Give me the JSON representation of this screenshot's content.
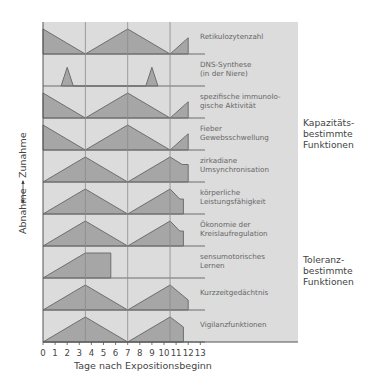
{
  "chart_data": {
    "type": "area",
    "title": "",
    "xlabel": "Tage nach Expositionsbeginn",
    "ylabel": "Abnahme ←—→ Zunahme",
    "ylabel_low": "Abnahme",
    "ylabel_high": "Zunahme",
    "x_ticks": [
      "0",
      "1",
      "2",
      "3",
      "4",
      "5",
      "6",
      "7",
      "8",
      "9",
      "10",
      "11",
      "12",
      "13"
    ],
    "xlim": [
      0,
      13
    ],
    "vertical_gridlines": [
      3.5,
      7,
      10.5
    ],
    "groups": [
      {
        "label": "Kapazitäts-\nbestimmte\nFunktionen",
        "rows": [
          0,
          1,
          2,
          3
        ]
      },
      {
        "label": "Toleranz-\nbestimmte\nFunktionen",
        "rows": [
          4,
          5,
          6,
          7,
          8,
          9
        ]
      }
    ],
    "series": [
      {
        "name": "Retikulozytenzahl",
        "points": [
          [
            0,
            1
          ],
          [
            3.5,
            0
          ],
          [
            7,
            1
          ],
          [
            10.5,
            0
          ],
          [
            12,
            0.65
          ],
          [
            12,
            0
          ]
        ]
      },
      {
        "name": "DNS-Synthese (in der Niere)",
        "points": [
          [
            1.5,
            0
          ],
          [
            2,
            0.75
          ],
          [
            2.5,
            0
          ],
          [
            8.5,
            0
          ],
          [
            9,
            0.75
          ],
          [
            9.5,
            0
          ]
        ]
      },
      {
        "name": "spezifische immunologische Aktivität",
        "points": [
          [
            0,
            1
          ],
          [
            3.5,
            0
          ],
          [
            7,
            1
          ],
          [
            10.5,
            0
          ],
          [
            12,
            0.65
          ],
          [
            12,
            0
          ]
        ]
      },
      {
        "name": "Fieber Gewebsschwellung",
        "points": [
          [
            0,
            1
          ],
          [
            3.5,
            0
          ],
          [
            7,
            1
          ],
          [
            10.5,
            0
          ],
          [
            12,
            0.65
          ],
          [
            12,
            0
          ]
        ]
      },
      {
        "name": "zirkadiane Umsynchronisation",
        "points": [
          [
            0,
            0
          ],
          [
            3.5,
            1
          ],
          [
            7,
            0
          ],
          [
            10.5,
            1
          ],
          [
            11.5,
            0.7
          ],
          [
            12,
            0.7
          ],
          [
            12,
            0
          ]
        ]
      },
      {
        "name": "körperliche Leistungsfähigkeit",
        "points": [
          [
            0,
            0
          ],
          [
            3.5,
            1
          ],
          [
            7,
            0
          ],
          [
            10.5,
            1
          ],
          [
            11.3,
            0.6
          ],
          [
            11.6,
            0.6
          ],
          [
            11.6,
            0
          ]
        ]
      },
      {
        "name": "Ökonomie der Kreislaufregulation",
        "points": [
          [
            0,
            0
          ],
          [
            3.5,
            1
          ],
          [
            7,
            0
          ],
          [
            10.5,
            1
          ],
          [
            11.3,
            0.6
          ],
          [
            11.6,
            0.6
          ],
          [
            11.6,
            0
          ]
        ]
      },
      {
        "name": "sensumotorisches Lernen",
        "points": [
          [
            0,
            0
          ],
          [
            3.5,
            1
          ],
          [
            5.6,
            1
          ],
          [
            5.6,
            0
          ]
        ]
      },
      {
        "name": "Kurzzeitgedächtnis",
        "points": [
          [
            0,
            0
          ],
          [
            3.5,
            1
          ],
          [
            7,
            0
          ],
          [
            10.5,
            1
          ],
          [
            12,
            0.4
          ],
          [
            12,
            0
          ]
        ]
      },
      {
        "name": "Vigilanzfunktionen",
        "points": [
          [
            0,
            0
          ],
          [
            3.5,
            1
          ],
          [
            7,
            0
          ],
          [
            10.5,
            1
          ],
          [
            11.6,
            0.6
          ],
          [
            11.6,
            0
          ]
        ]
      }
    ]
  },
  "rows": [
    {
      "line1": "Retikulozytenzahl",
      "line2": ""
    },
    {
      "line1": "DNS-Synthese",
      "line2": "(in der Niere)"
    },
    {
      "line1": "spezifische immunolo-",
      "line2": "gische Aktivität"
    },
    {
      "line1": "Fieber",
      "line2": "Gewebsschwellung"
    },
    {
      "line1": "zirkadiane",
      "line2": "Umsynchronisation"
    },
    {
      "line1": "körperliche",
      "line2": "Leistungsfähigkeit"
    },
    {
      "line1": "Ökonomie der",
      "line2": "Kreislaufregulation"
    },
    {
      "line1": "sensumotorisches",
      "line2": "Lernen"
    },
    {
      "line1": "Kurzzeitgedächtnis",
      "line2": ""
    },
    {
      "line1": "Vigilanzfunktionen",
      "line2": ""
    }
  ],
  "groups": {
    "capacity": {
      "l1": "Kapazitäts-",
      "l2": "bestimmte",
      "l3": "Funktionen"
    },
    "tolerance": {
      "l1": "Toleranz-",
      "l2": "bestimmte",
      "l3": "Funktionen"
    }
  },
  "axis": {
    "xlabel": "Tage nach Expositionsbeginn",
    "y_low": "Abnahme",
    "y_high": "Zunahme",
    "ticks": [
      "0",
      "1",
      "2",
      "3",
      "4",
      "5",
      "6",
      "7",
      "8",
      "9",
      "10",
      "11",
      "12",
      "13"
    ]
  },
  "colors": {
    "panel_bg": "#dcdcdc",
    "fill": "#a6a6a6",
    "stroke": "#6e6e6e",
    "grid": "#8a8a8a"
  }
}
